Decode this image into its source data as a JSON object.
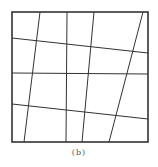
{
  "figure": {
    "caption": "(b)",
    "stroke_color": "#333333",
    "border_color": "#333333",
    "border": {
      "x1": 12,
      "y1": 12,
      "x2": 148,
      "y2": 142
    },
    "grid_lines": {
      "vertical": [
        {
          "x1": 40,
          "y1": 12,
          "x2": 24,
          "y2": 142
        },
        {
          "x1": 67,
          "y1": 12,
          "x2": 66,
          "y2": 142
        },
        {
          "x1": 94,
          "y1": 12,
          "x2": 82,
          "y2": 142
        },
        {
          "x1": 143,
          "y1": 12,
          "x2": 109,
          "y2": 142
        }
      ],
      "horizontal": [
        {
          "x1": 12,
          "y1": 38,
          "x2": 148,
          "y2": 53
        },
        {
          "x1": 12,
          "y1": 73,
          "x2": 148,
          "y2": 74
        },
        {
          "x1": 12,
          "y1": 104,
          "x2": 148,
          "y2": 119
        }
      ]
    }
  }
}
